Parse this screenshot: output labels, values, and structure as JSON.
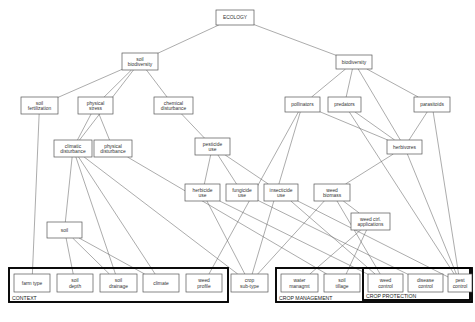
{
  "figure": {
    "caption": ""
  },
  "chart_data": {
    "type": "diagram",
    "title": "ECOLOGY",
    "nodes": [
      {
        "id": "ecology",
        "label": [
          "ECOLOGY"
        ],
        "x": 216,
        "y": 10,
        "w": 38,
        "h": 15
      },
      {
        "id": "soil_biodiversity",
        "label": [
          "soil",
          "biodiversity"
        ],
        "x": 122,
        "y": 53,
        "w": 36,
        "h": 17
      },
      {
        "id": "biodiversity",
        "label": [
          "biodiversity"
        ],
        "x": 336,
        "y": 55,
        "w": 36,
        "h": 14
      },
      {
        "id": "soil_fertilization",
        "label": [
          "soil",
          "fertilization"
        ],
        "x": 21,
        "y": 97,
        "w": 37,
        "h": 17
      },
      {
        "id": "physical_stress",
        "label": [
          "physical",
          "stress"
        ],
        "x": 78,
        "y": 97,
        "w": 35,
        "h": 17
      },
      {
        "id": "chemical_disturbance",
        "label": [
          "chemical",
          "disturbance"
        ],
        "x": 154,
        "y": 97,
        "w": 39,
        "h": 17
      },
      {
        "id": "pollinators",
        "label": [
          "pollinators"
        ],
        "x": 285,
        "y": 97,
        "w": 35,
        "h": 15
      },
      {
        "id": "predators",
        "label": [
          "predators"
        ],
        "x": 328,
        "y": 97,
        "w": 33,
        "h": 15
      },
      {
        "id": "parasitoids",
        "label": [
          "parasitoids"
        ],
        "x": 414,
        "y": 97,
        "w": 36,
        "h": 15
      },
      {
        "id": "climatic_disturbance",
        "label": [
          "climatic",
          "disturbance"
        ],
        "x": 54,
        "y": 140,
        "w": 38,
        "h": 17
      },
      {
        "id": "physical_disturbance",
        "label": [
          "physical",
          "disturbance"
        ],
        "x": 94,
        "y": 140,
        "w": 38,
        "h": 17
      },
      {
        "id": "pesticide_use",
        "label": [
          "pesticide",
          "use"
        ],
        "x": 195,
        "y": 138,
        "w": 35,
        "h": 17
      },
      {
        "id": "herbivores",
        "label": [
          "herbivores"
        ],
        "x": 387,
        "y": 140,
        "w": 35,
        "h": 14
      },
      {
        "id": "herbicide_use",
        "label": [
          "herbicide",
          "use"
        ],
        "x": 185,
        "y": 184,
        "w": 35,
        "h": 17
      },
      {
        "id": "fungicide_use",
        "label": [
          "fungicide",
          "use"
        ],
        "x": 226,
        "y": 184,
        "w": 32,
        "h": 17
      },
      {
        "id": "insecticide_use",
        "label": [
          "insecticide",
          "use"
        ],
        "x": 264,
        "y": 184,
        "w": 34,
        "h": 17
      },
      {
        "id": "weed_biomass",
        "label": [
          "weed",
          "biomass"
        ],
        "x": 314,
        "y": 184,
        "w": 36,
        "h": 17
      },
      {
        "id": "weed_ctrl_applications",
        "label": [
          "weed ctrl.",
          "applications"
        ],
        "x": 351,
        "y": 213,
        "w": 39,
        "h": 17
      },
      {
        "id": "soil",
        "label": [
          "soil"
        ],
        "x": 47,
        "y": 222,
        "w": 35,
        "h": 16
      },
      {
        "id": "farm_type",
        "label": [
          "farm type"
        ],
        "x": 14,
        "y": 274,
        "w": 36,
        "h": 18
      },
      {
        "id": "soil_depth",
        "label": [
          "soil",
          "depth"
        ],
        "x": 57,
        "y": 274,
        "w": 36,
        "h": 18
      },
      {
        "id": "soil_drainage",
        "label": [
          "soil",
          "drainage"
        ],
        "x": 100,
        "y": 274,
        "w": 37,
        "h": 18
      },
      {
        "id": "climate",
        "label": [
          "climate"
        ],
        "x": 143,
        "y": 274,
        "w": 36,
        "h": 18
      },
      {
        "id": "weed_profile",
        "label": [
          "weed",
          "profile"
        ],
        "x": 186,
        "y": 274,
        "w": 36,
        "h": 18
      },
      {
        "id": "crop_subtype",
        "label": [
          "crop",
          "sub-type"
        ],
        "x": 231,
        "y": 274,
        "w": 37,
        "h": 18
      },
      {
        "id": "water_managmt",
        "label": [
          "water",
          "managmt"
        ],
        "x": 281,
        "y": 274,
        "w": 37,
        "h": 18
      },
      {
        "id": "soil_tillage",
        "label": [
          "soil",
          "tillage"
        ],
        "x": 324,
        "y": 274,
        "w": 36,
        "h": 18
      },
      {
        "id": "weed_control",
        "label": [
          "weed",
          "control"
        ],
        "x": 368,
        "y": 274,
        "w": 35,
        "h": 18
      },
      {
        "id": "disease_control",
        "label": [
          "disease",
          "control"
        ],
        "x": 408,
        "y": 274,
        "w": 35,
        "h": 18
      },
      {
        "id": "pest_control",
        "label": [
          "pest",
          "control"
        ],
        "x": 448,
        "y": 274,
        "w": 24,
        "h": 18
      }
    ],
    "groups": [
      {
        "id": "context",
        "label": "CONTEXT",
        "x": 9,
        "y": 268,
        "w": 219,
        "h": 34
      },
      {
        "id": "crop_management",
        "label": "CROP MANAGEMENT",
        "x": 276,
        "y": 268,
        "w": 196,
        "h": 34
      },
      {
        "id": "crop_protection",
        "label": "CROP PROTECTION",
        "x": 363,
        "y": 268,
        "w": 107,
        "h": 32
      }
    ],
    "edges": [
      [
        "ecology",
        "soil_biodiversity"
      ],
      [
        "ecology",
        "biodiversity"
      ],
      [
        "soil_biodiversity",
        "soil_fertilization"
      ],
      [
        "soil_biodiversity",
        "physical_stress"
      ],
      [
        "soil_biodiversity",
        "chemical_disturbance"
      ],
      [
        "soil_biodiversity",
        "climatic_disturbance"
      ],
      [
        "physical_stress",
        "climatic_disturbance"
      ],
      [
        "physical_stress",
        "physical_disturbance"
      ],
      [
        "chemical_disturbance",
        "pesticide_use"
      ],
      [
        "biodiversity",
        "pollinators"
      ],
      [
        "biodiversity",
        "predators"
      ],
      [
        "biodiversity",
        "parasitoids"
      ],
      [
        "biodiversity",
        "herbivores"
      ],
      [
        "pollinators",
        "herbivores"
      ],
      [
        "predators",
        "herbivores"
      ],
      [
        "parasitoids",
        "herbivores"
      ],
      [
        "pesticide_use",
        "herbicide_use"
      ],
      [
        "pesticide_use",
        "fungicide_use"
      ],
      [
        "pesticide_use",
        "insecticide_use"
      ],
      [
        "soil_fertilization",
        "farm_type"
      ],
      [
        "climatic_disturbance",
        "soil"
      ],
      [
        "climatic_disturbance",
        "soil_drainage"
      ],
      [
        "climatic_disturbance",
        "climate"
      ],
      [
        "climatic_disturbance",
        "crop_subtype"
      ],
      [
        "physical_disturbance",
        "soil_tillage"
      ],
      [
        "soil",
        "soil_depth"
      ],
      [
        "soil",
        "soil_drainage"
      ],
      [
        "soil",
        "climate"
      ],
      [
        "herbicide_use",
        "weed_control"
      ],
      [
        "herbicide_use",
        "crop_subtype"
      ],
      [
        "fungicide_use",
        "disease_control"
      ],
      [
        "insecticide_use",
        "pest_control"
      ],
      [
        "insecticide_use",
        "weed_control"
      ],
      [
        "weed_biomass",
        "weed_ctrl_applications"
      ],
      [
        "weed_biomass",
        "crop_subtype"
      ],
      [
        "weed_biomass",
        "weed_control"
      ],
      [
        "weed_ctrl_applications",
        "water_managmt"
      ],
      [
        "weed_ctrl_applications",
        "soil_tillage"
      ],
      [
        "herbivores",
        "weed_biomass"
      ],
      [
        "herbivores",
        "pest_control"
      ],
      [
        "pollinators",
        "crop_subtype"
      ],
      [
        "pollinators",
        "weed_profile"
      ],
      [
        "predators",
        "pest_control"
      ],
      [
        "parasitoids",
        "pest_control"
      ]
    ]
  }
}
